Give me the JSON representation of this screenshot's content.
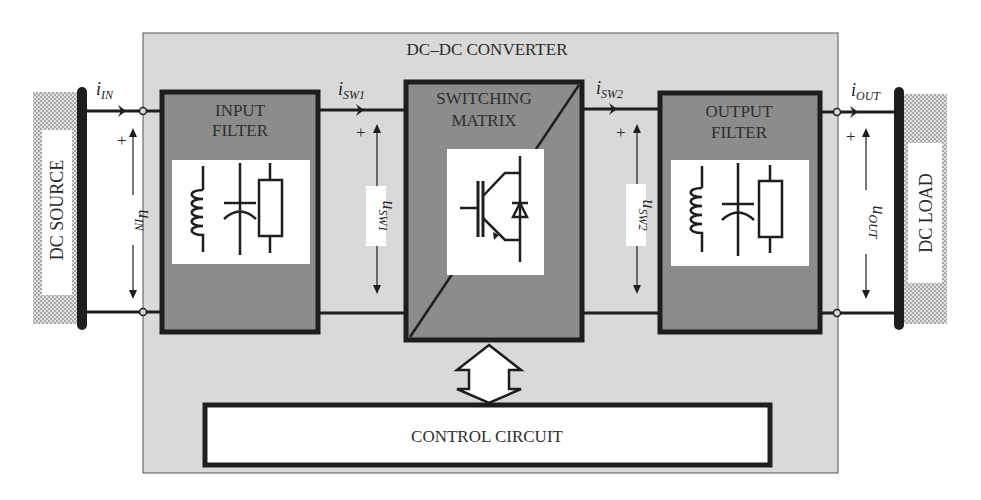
{
  "converter": {
    "title": "DC–DC CONVERTER"
  },
  "source": {
    "label": "DC SOURCE"
  },
  "load": {
    "label": "DC LOAD"
  },
  "blocks": {
    "input_filter": {
      "line1": "INPUT",
      "line2": "FILTER"
    },
    "switching_matrix": {
      "line1": "SWITCHING",
      "line2": "MATRIX"
    },
    "output_filter": {
      "line1": "OUTPUT",
      "line2": "FILTER"
    },
    "control_circuit": {
      "label": "CONTROL CIRCUIT"
    }
  },
  "signals": {
    "i_in": {
      "base": "i",
      "sub": "IN"
    },
    "i_sw1": {
      "base": "i",
      "sub": "SW1"
    },
    "i_sw2": {
      "base": "i",
      "sub": "SW2"
    },
    "i_out": {
      "base": "i",
      "sub": "OUT"
    },
    "u_in": {
      "base": "u",
      "sub": "IN"
    },
    "u_sw1": {
      "base": "u",
      "sub": "SW1"
    },
    "u_sw2": {
      "base": "u",
      "sub": "SW2"
    },
    "u_out": {
      "base": "u",
      "sub": "OUT"
    },
    "plus": "+"
  },
  "colors": {
    "converter_bg": "#d9d9d9",
    "block_fill": "#8c8c8c",
    "line": "#1e1e1e",
    "hatch": "#b5b5b5"
  }
}
